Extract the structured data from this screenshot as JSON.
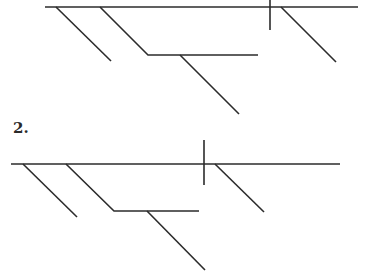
{
  "diagrams": [
    {
      "id": "diagram-1",
      "label": "",
      "stroke_color": "#2b2b2b",
      "baseline": {
        "x1": 45,
        "y1": 7,
        "x2": 358,
        "y2": 7
      },
      "divider": {
        "x1": 270,
        "y1": 0,
        "x2": 270,
        "y2": 30
      },
      "modifier_left": {
        "x1": 56,
        "y1": 7,
        "x2": 111,
        "y2": 61
      },
      "phrase_stem": {
        "points": "100,7 148,55 258,55"
      },
      "phrase_modifier": {
        "x1": 180,
        "y1": 55,
        "x2": 239,
        "y2": 114
      },
      "modifier_right": {
        "x1": 281,
        "y1": 7,
        "x2": 336,
        "y2": 62
      }
    },
    {
      "id": "diagram-2",
      "label": "2.",
      "label_position": {
        "x": 13,
        "y": 121
      },
      "stroke_color": "#2b2b2b",
      "baseline": {
        "x1": 11,
        "y1": 164,
        "x2": 340,
        "y2": 164
      },
      "divider": {
        "x1": 204,
        "y1": 140,
        "x2": 204,
        "y2": 185
      },
      "modifier_left": {
        "x1": 23,
        "y1": 164,
        "x2": 77,
        "y2": 217
      },
      "phrase_stem": {
        "points": "66,164 114,211 199,211"
      },
      "phrase_modifier": {
        "x1": 147,
        "y1": 211,
        "x2": 205,
        "y2": 270
      },
      "modifier_right": {
        "x1": 215,
        "y1": 164,
        "x2": 264,
        "y2": 212
      }
    }
  ]
}
